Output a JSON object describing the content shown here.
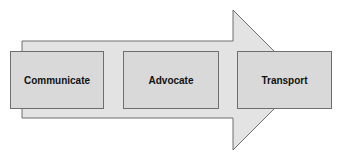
{
  "diagram": {
    "type": "process-arrow",
    "colors": {
      "arrow_fill": "#e3e3e3",
      "box_fill": "#d9d9d9",
      "stroke": "#6e6e6e",
      "text": "#111111"
    },
    "steps": [
      {
        "label": "Communicate"
      },
      {
        "label": "Advocate"
      },
      {
        "label": "Transport"
      }
    ]
  }
}
